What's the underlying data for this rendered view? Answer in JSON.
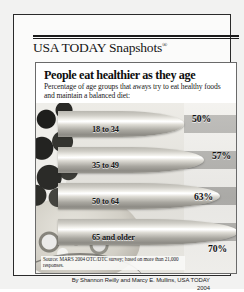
{
  "brand": {
    "name": "USA TODAY Snapshots",
    "registered_mark": "®"
  },
  "panel": {
    "title": "People eat healthier as they age",
    "subtitle": "Percentage of age groups that aways try to eat healthy foods and maintain a balanced diet:"
  },
  "source": "Source: MARS 2004 OTC/DTC survey; based on more than 21,000 responses.",
  "byline": {
    "line1": "By Shannon Reilly and Marcy E. Mullins, USA TODAY",
    "line2": "2004"
  },
  "chart_data": {
    "type": "bar",
    "title": "People eat healthier as they age",
    "subtitle": "Percentage of age groups that aways try to eat healthy foods and maintain a balanced diet:",
    "orientation": "horizontal",
    "categories": [
      "18 to 34",
      "35 to 49",
      "50 to 64",
      "65 and older"
    ],
    "values": [
      50,
      57,
      63,
      70
    ],
    "value_labels": [
      "50%",
      "57%",
      "63%",
      "70%"
    ],
    "xlabel": "",
    "ylabel": "",
    "xlim": [
      0,
      80
    ],
    "grid": false,
    "legend": false,
    "units": "percent",
    "source": "Source: MARS 2004 OTC/DTC survey; based on more than 21,000 responses.",
    "colors": {
      "bar": "#d8d6cf",
      "text": "#17171a",
      "background": "#efeeea"
    }
  }
}
